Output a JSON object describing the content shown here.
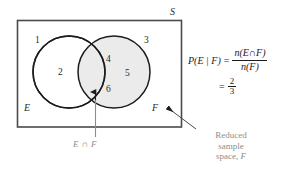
{
  "figure": {
    "sets": {
      "universe_label": "S",
      "left_set_label": "E",
      "right_set_label": "F"
    },
    "regions": [
      {
        "name": "outside-both",
        "value": "1"
      },
      {
        "name": "E-only",
        "value": "2"
      },
      {
        "name": "outside-both-right",
        "value": "3"
      },
      {
        "name": "intersection-top",
        "value": "4"
      },
      {
        "name": "F-only",
        "value": "5"
      },
      {
        "name": "intersection-bottom",
        "value": "6"
      }
    ],
    "numbers": {
      "n1": "1",
      "n2": "2",
      "n3": "3",
      "n4": "4",
      "n5": "5",
      "n6": "6"
    },
    "captions": {
      "intersection": "E ∩ F",
      "reduced_line1": "Reduced",
      "reduced_line2": "sample",
      "reduced_line3": "space,",
      "reduced_set": "F"
    },
    "formula": {
      "lhs": "P(E | F)",
      "equals": "=",
      "numerator": "n(E∩F)",
      "denominator": "n(F)",
      "equals2": "=",
      "result_numerator": "2",
      "result_denominator": "3"
    },
    "colors": {
      "shaded_set": "#ebebeb",
      "stroke": "#1c1c1c",
      "annotation_gray": "#8d8d8d",
      "background": "#ffffff"
    }
  }
}
